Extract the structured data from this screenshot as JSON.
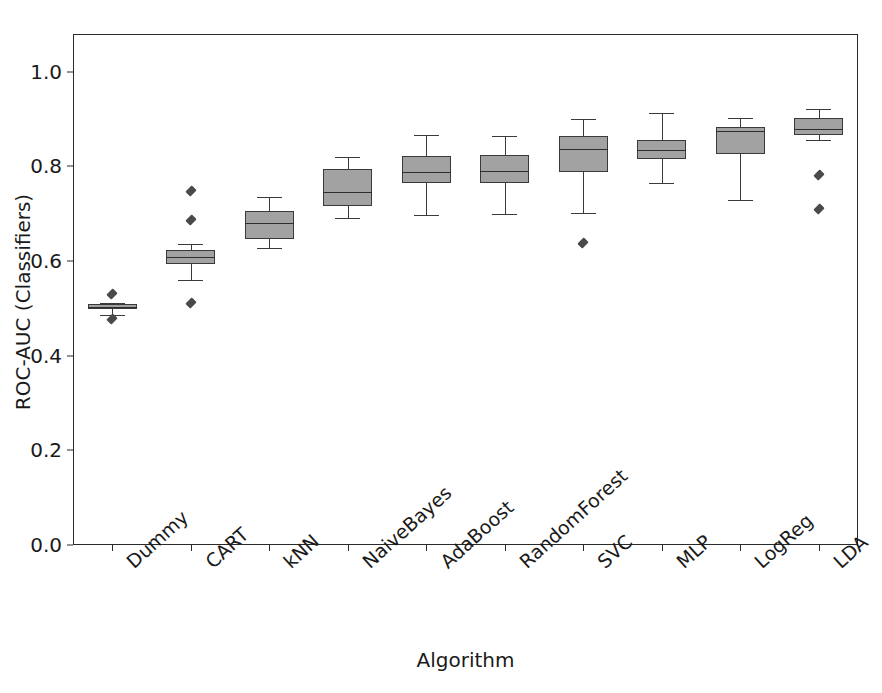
{
  "chart_data": {
    "type": "box",
    "title": "",
    "xlabel": "Algorithm",
    "ylabel": "ROC-AUC (Classifiers)",
    "ylim": [
      0.0,
      1.08
    ],
    "xlim": [
      0,
      10
    ],
    "grid": false,
    "legend": null,
    "yticks": [
      "0.0",
      "0.2",
      "0.4",
      "0.6",
      "0.8",
      "1.0"
    ],
    "ytick_values": [
      0.0,
      0.2,
      0.4,
      0.6,
      0.8,
      1.0
    ],
    "categories": [
      "Dummy",
      "CART",
      "kNN",
      "NaiveBayes",
      "AdaBoost",
      "RandomForest",
      "SVC",
      "MLP",
      "LogReg",
      "LDA"
    ],
    "box_color": "#a2a2a2",
    "line_color": "#3a3a3a",
    "boxes": [
      {
        "name": "Dummy",
        "whisker_low": 0.487,
        "q1": 0.499,
        "median": 0.504,
        "q3": 0.509,
        "whisker_high": 0.512,
        "fliers": [
          0.531,
          0.478
        ]
      },
      {
        "name": "CART",
        "whisker_low": 0.56,
        "q1": 0.594,
        "median": 0.608,
        "q3": 0.624,
        "whisker_high": 0.636,
        "fliers": [
          0.749,
          0.686,
          0.511
        ]
      },
      {
        "name": "kNN",
        "whisker_low": 0.627,
        "q1": 0.646,
        "median": 0.681,
        "q3": 0.706,
        "whisker_high": 0.735,
        "fliers": []
      },
      {
        "name": "NaiveBayes",
        "whisker_low": 0.692,
        "q1": 0.716,
        "median": 0.746,
        "q3": 0.795,
        "whisker_high": 0.821,
        "fliers": []
      },
      {
        "name": "AdaBoost",
        "whisker_low": 0.697,
        "q1": 0.766,
        "median": 0.789,
        "q3": 0.823,
        "whisker_high": 0.866,
        "fliers": []
      },
      {
        "name": "RandomForest",
        "whisker_low": 0.7,
        "q1": 0.766,
        "median": 0.791,
        "q3": 0.824,
        "whisker_high": 0.865,
        "fliers": []
      },
      {
        "name": "SVC",
        "whisker_low": 0.702,
        "q1": 0.788,
        "median": 0.836,
        "q3": 0.864,
        "whisker_high": 0.901,
        "fliers": [
          0.639
        ]
      },
      {
        "name": "MLP",
        "whisker_low": 0.766,
        "q1": 0.816,
        "median": 0.834,
        "q3": 0.856,
        "whisker_high": 0.914,
        "fliers": []
      },
      {
        "name": "LogReg",
        "whisker_low": 0.73,
        "q1": 0.827,
        "median": 0.874,
        "q3": 0.884,
        "whisker_high": 0.903,
        "fliers": []
      },
      {
        "name": "LDA",
        "whisker_low": 0.856,
        "q1": 0.866,
        "median": 0.879,
        "q3": 0.903,
        "whisker_high": 0.921,
        "fliers": [
          0.781,
          0.711
        ]
      }
    ]
  }
}
